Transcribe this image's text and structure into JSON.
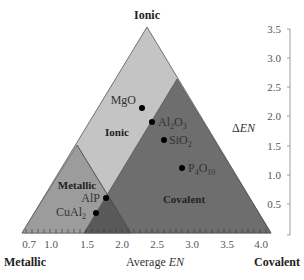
{
  "corners": {
    "top": "Ionic",
    "bottom_left": "Metallic",
    "bottom_right": "Covalent"
  },
  "regions": {
    "ionic": "Ionic",
    "metallic": "Metallic",
    "covalent": "Covalent"
  },
  "x_axis": {
    "label_prefix": "Average ",
    "label_var": "EN",
    "ticks": [
      "0.7",
      "1.0",
      "1.5",
      "2.0",
      "2.5",
      "3.0",
      "3.5",
      "4.0"
    ]
  },
  "y_axis": {
    "label_prefix": "Δ",
    "label_var": "EN",
    "ticks": [
      "0.5",
      "1.0",
      "1.5",
      "2.0",
      "2.5",
      "3.0",
      "3.5"
    ]
  },
  "compounds": [
    {
      "name": "MgO",
      "avg_en": 2.35,
      "delta_en": 2.15
    },
    {
      "name": "Al2O3",
      "avg_en": 2.5,
      "delta_en": 1.85
    },
    {
      "name": "SiO2",
      "avg_en": 2.65,
      "delta_en": 1.55
    },
    {
      "name": "P4O10",
      "avg_en": 2.95,
      "delta_en": 1.1
    },
    {
      "name": "AlP",
      "avg_en": 1.8,
      "delta_en": 0.6
    },
    {
      "name": "CuAl2",
      "avg_en": 1.7,
      "delta_en": 0.35
    }
  ],
  "compound_labels": {
    "mgo": "MgO",
    "al2o3_main": "Al",
    "al2o3_sub1": "2",
    "al2o3_mid": "O",
    "al2o3_sub2": "3",
    "sio2_main": "SiO",
    "sio2_sub": "2",
    "p4o10_main": "P",
    "p4o10_sub1": "4",
    "p4o10_mid": "O",
    "p4o10_sub2": "10",
    "alp": "AlP",
    "cual2_main": "CuAl",
    "cual2_sub": "2"
  },
  "colors": {
    "ionic": "#c4c4c4",
    "metallic": "#9c9c9c",
    "covalent": "#6e6e6e",
    "overlap": "#595959"
  }
}
